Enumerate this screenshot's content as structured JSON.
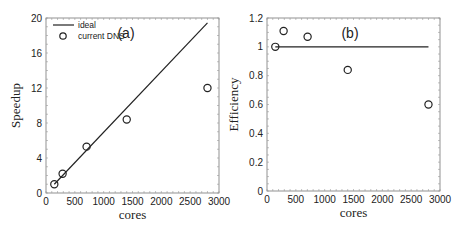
{
  "chart_data": [
    {
      "type": "scatter",
      "panel_label": "(a)",
      "title": "",
      "xlabel": "cores",
      "ylabel": "Speedup",
      "xlim": [
        0,
        3000
      ],
      "ylim": [
        0,
        20
      ],
      "xticks": [
        "0",
        "500",
        "1000",
        "1500",
        "2000",
        "2500",
        "3000"
      ],
      "yticks": [
        "0",
        "4",
        "8",
        "12",
        "16",
        "20"
      ],
      "grid": false,
      "legend_position": "upper left",
      "series": [
        {
          "name": "ideal",
          "style": "line",
          "x": [
            144,
            2800
          ],
          "y": [
            1,
            19.44
          ]
        },
        {
          "name": "current DNS",
          "style": "circle",
          "x": [
            144,
            288,
            704,
            1400,
            2800
          ],
          "y": [
            1.0,
            2.2,
            5.3,
            8.4,
            12.0
          ]
        }
      ]
    },
    {
      "type": "scatter",
      "panel_label": "(b)",
      "title": "",
      "xlabel": "cores",
      "ylabel": "Efficiency",
      "xlim": [
        0,
        3000
      ],
      "ylim": [
        0,
        1.2
      ],
      "xticks": [
        "0",
        "500",
        "1000",
        "1500",
        "2000",
        "2500",
        "3000"
      ],
      "yticks": [
        "0",
        "0.2",
        "0.4",
        "0.6",
        "0.8",
        "1",
        "1.2"
      ],
      "grid": false,
      "series": [
        {
          "name": "ideal",
          "style": "line",
          "x": [
            144,
            2800
          ],
          "y": [
            1,
            1
          ]
        },
        {
          "name": "current DNS",
          "style": "circle",
          "x": [
            144,
            288,
            704,
            1400,
            2800
          ],
          "y": [
            1.0,
            1.11,
            1.07,
            0.84,
            0.6
          ]
        }
      ]
    }
  ],
  "legend": {
    "ideal_label": "ideal",
    "dns_label": "current DNS"
  }
}
